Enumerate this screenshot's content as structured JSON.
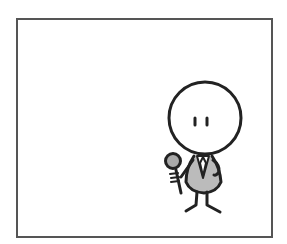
{
  "comic": {
    "panel_count": 1,
    "character": "stick-figure-reporter",
    "prop": "microphone",
    "colors": {
      "stroke": "#222222",
      "frame": "#555555",
      "fill_gray": "#bbbbbb",
      "background": "#ffffff"
    }
  }
}
